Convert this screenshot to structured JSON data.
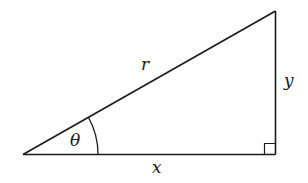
{
  "diagram": {
    "type": "right-triangle",
    "labels": {
      "hypotenuse": "r",
      "opposite": "y",
      "adjacent": "x",
      "angle": "θ"
    },
    "colors": {
      "stroke": "#1a1a1a",
      "background": "#ffffff"
    }
  }
}
